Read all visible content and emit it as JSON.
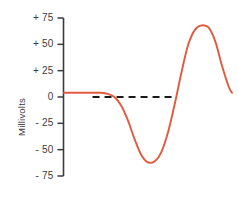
{
  "chart_data": {
    "type": "line",
    "title": "",
    "xlabel": "",
    "ylabel": "Millivolts",
    "ylim": [
      -75,
      75
    ],
    "yticks": [
      75,
      50,
      25,
      0,
      -25,
      -50,
      -75
    ],
    "ytick_labels": [
      "+ 75",
      "+ 50",
      "+ 25",
      "0",
      "- 25",
      "- 50",
      "- 75"
    ],
    "grid": false,
    "legend": null,
    "xaxis_visible": false,
    "series": [
      {
        "name": "waveform",
        "color": "#e2593f",
        "style": "solid",
        "x": [
          0,
          6,
          12,
          18,
          22,
          26,
          30,
          34,
          38,
          42,
          46,
          50,
          54,
          58,
          62,
          66,
          70,
          74,
          78,
          82,
          86,
          90,
          94,
          98,
          100
        ],
        "values": [
          4,
          4,
          4,
          4,
          4,
          3,
          0,
          -8,
          -22,
          -40,
          -55,
          -62,
          -61,
          -52,
          -33,
          -6,
          24,
          50,
          64,
          68,
          66,
          53,
          30,
          10,
          4
        ]
      }
    ],
    "annotations": [
      {
        "name": "zero-reference-line",
        "type": "hline",
        "value": 0,
        "style": "dashed",
        "color": "#1a1a1a",
        "x_start": 17,
        "x_end": 64
      }
    ],
    "axis_color": "#3b3b3b",
    "background": "#ffffff"
  }
}
